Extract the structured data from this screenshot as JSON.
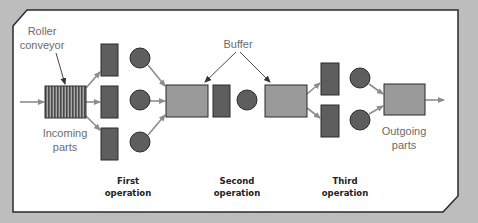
{
  "diagram": {
    "colors": {
      "background": "#bdbdbd",
      "panel": "#ffffff",
      "frame": "#2a2a2a",
      "machine": "#5e5e5e",
      "buffer": "#9a9a9a",
      "arrow": "#8c8c8c",
      "label": "#6b6b6b",
      "stage_label": "#222222"
    },
    "labels": {
      "roller_conveyor_line1": "Roller",
      "roller_conveyor_line2": "conveyor",
      "buffer": "Buffer",
      "incoming_line1": "Incoming",
      "incoming_line2": "parts",
      "outgoing_line1": "Outgoing",
      "outgoing_line2": "parts"
    },
    "stages": [
      {
        "line1": "First",
        "line2": "operation",
        "parallel_stations": 3
      },
      {
        "line1": "Second",
        "line2": "operation",
        "parallel_stations": 1
      },
      {
        "line1": "Third",
        "line2": "operation",
        "parallel_stations": 2
      }
    ],
    "nodes": {
      "conveyor": "roller-conveyor",
      "buffers": [
        "buffer-1",
        "buffer-2"
      ],
      "output": "outgoing-buffer"
    }
  }
}
